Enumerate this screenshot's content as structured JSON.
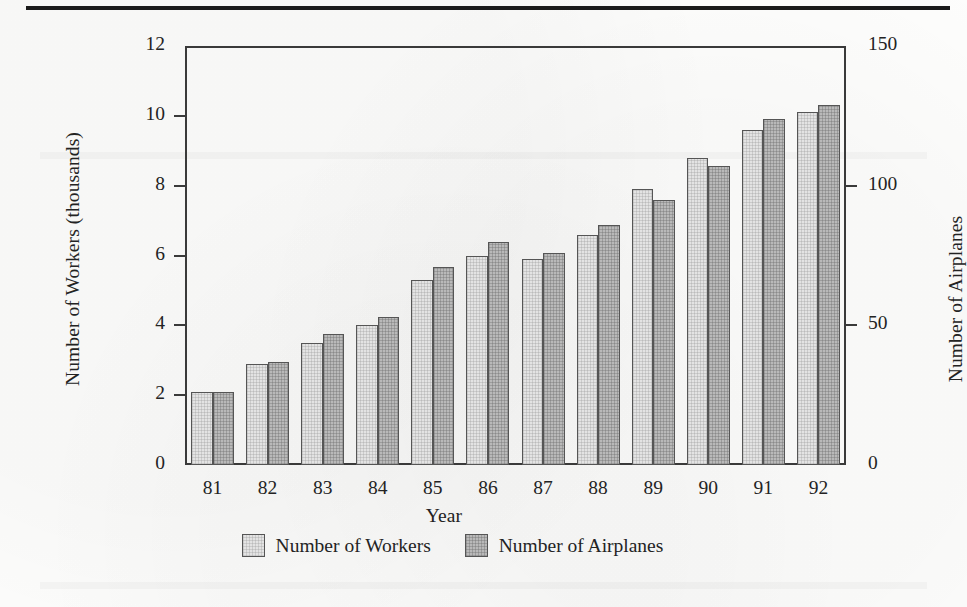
{
  "figure": {
    "top_rule": true
  },
  "legend": {
    "position": "bottom-center",
    "items": [
      {
        "label": "Number of Workers",
        "color": "#e3e3e3",
        "key": "workers"
      },
      {
        "label": "Number of Airplanes",
        "color": "#b9b9b9",
        "key": "airplanes"
      }
    ]
  },
  "axes": {
    "x_title": "Year",
    "y_left_title": "Number of Workers (thousands)",
    "y_right_title": "Number of Airplanes",
    "y_left_ticks": [
      "0",
      "2",
      "4",
      "6",
      "8",
      "10",
      "12"
    ],
    "y_right_ticks": [
      "0",
      "50",
      "100",
      "150"
    ]
  },
  "chart_data": {
    "type": "bar",
    "title": "",
    "subtitle": "",
    "xlabel": "Year",
    "ylabel": "Number of Workers (thousands)",
    "y2label": "Number of Airplanes",
    "grid": false,
    "legend_position": "bottom-center",
    "categories": [
      "81",
      "82",
      "83",
      "84",
      "85",
      "86",
      "87",
      "88",
      "89",
      "90",
      "91",
      "92"
    ],
    "ylim": [
      0,
      12
    ],
    "y2lim": [
      0,
      150
    ],
    "yticks": [
      0,
      2,
      4,
      6,
      8,
      10,
      12
    ],
    "y2ticks": [
      0,
      50,
      100,
      150
    ],
    "series": [
      {
        "name": "Number of Workers",
        "axis": "left",
        "units": "thousands",
        "color": "#e3e3e3",
        "values": [
          2.1,
          2.9,
          3.5,
          4.0,
          5.3,
          6.0,
          5.9,
          6.6,
          7.9,
          8.8,
          9.6,
          10.1
        ]
      },
      {
        "name": "Number of Airplanes",
        "axis": "right",
        "units": "airplanes",
        "color": "#b9b9b9",
        "values": [
          26,
          37,
          47,
          53,
          71,
          80,
          76,
          86,
          95,
          107,
          124,
          129
        ]
      }
    ]
  }
}
